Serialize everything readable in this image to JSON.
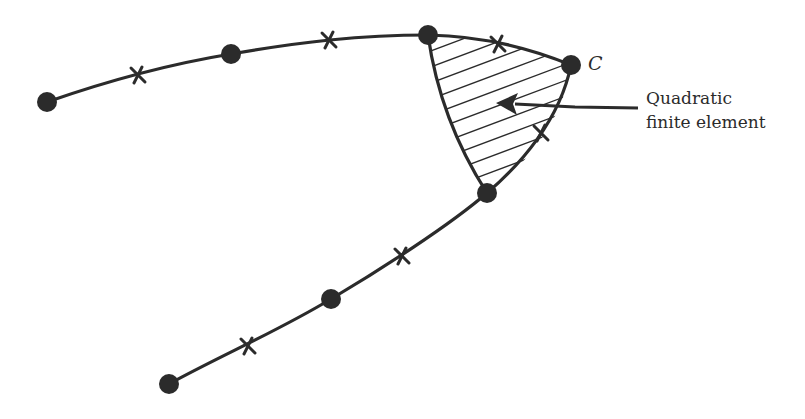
{
  "diagram": {
    "labels": {
      "corner": "C",
      "element_line1": "Quadratic",
      "element_line2": "finite element"
    },
    "colors": {
      "ink": "#2b2b2b",
      "background": "#ffffff"
    },
    "upper_boundary": {
      "nodes": [
        [
          47,
          102
        ],
        [
          231,
          54
        ],
        [
          428,
          35
        ],
        [
          571,
          65
        ]
      ],
      "midside_crosses": [
        [
          138,
          75
        ],
        [
          329,
          40
        ],
        [
          498,
          44
        ]
      ]
    },
    "lower_boundary": {
      "nodes": [
        [
          169,
          384
        ],
        [
          331,
          299
        ],
        [
          487,
          193
        ]
      ],
      "midside_crosses": [
        [
          248,
          346
        ],
        [
          402,
          256
        ],
        [
          541,
          133
        ]
      ]
    },
    "element": {
      "corner_nodes": [
        [
          428,
          35
        ],
        [
          571,
          65
        ],
        [
          487,
          193
        ]
      ],
      "hatched": true
    }
  }
}
